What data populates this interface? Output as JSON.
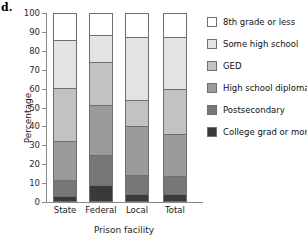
{
  "panel": {
    "letter": "d."
  },
  "chart_data": {
    "type": "bar",
    "subtype": "stacked-vertical-100pct",
    "title": "",
    "xlabel": "Prison facility",
    "ylabel": "Percentage",
    "ylim": [
      0,
      100
    ],
    "yticks": [
      0,
      10,
      20,
      30,
      40,
      50,
      60,
      70,
      80,
      90,
      100
    ],
    "ytick_labels": [
      "0",
      "10",
      "20",
      "30",
      "40",
      "50",
      "60",
      "70",
      "80",
      "90",
      "100"
    ],
    "grid": false,
    "legend_position": "right",
    "categories": [
      "State",
      "Federal",
      "Local",
      "Total"
    ],
    "series": [
      {
        "name": "College grad or more",
        "color": "#3a3a3a",
        "values": [
          2.5,
          8.5,
          3.5,
          3.5
        ]
      },
      {
        "name": "Postsecondary",
        "color": "#777777",
        "values": [
          9.0,
          16.0,
          10.5,
          10.0
        ]
      },
      {
        "name": "High school diploma",
        "color": "#9b9b9b",
        "values": [
          20.5,
          27.0,
          26.0,
          22.5
        ]
      },
      {
        "name": "GED",
        "color": "#c2c2c2",
        "values": [
          28.5,
          23.0,
          14.0,
          24.0
        ]
      },
      {
        "name": "Some high school",
        "color": "#e3e3e3",
        "values": [
          25.5,
          14.5,
          33.5,
          27.5
        ]
      },
      {
        "name": "8th grade or less",
        "color": "#ffffff",
        "values": [
          14.0,
          11.0,
          12.5,
          12.5
        ]
      }
    ],
    "stack_tops": {
      "State": [
        2.5,
        11.5,
        32.0,
        60.5,
        86.0,
        100.0
      ],
      "Federal": [
        8.5,
        24.5,
        51.5,
        74.5,
        89.0,
        100.0
      ],
      "Local": [
        3.5,
        14.0,
        40.0,
        54.0,
        87.5,
        100.0
      ],
      "Total": [
        3.5,
        13.5,
        36.0,
        60.0,
        87.5,
        100.0
      ]
    }
  },
  "legend": {
    "entries": [
      {
        "label": "8th grade or less",
        "color": "#ffffff"
      },
      {
        "label": "Some high school",
        "color": "#e3e3e3"
      },
      {
        "label": "GED",
        "color": "#c2c2c2"
      },
      {
        "label": "High school diploma",
        "color": "#9b9b9b"
      },
      {
        "label": "Postsecondary",
        "color": "#777777"
      },
      {
        "label": "College grad or more",
        "color": "#3a3a3a"
      }
    ]
  }
}
